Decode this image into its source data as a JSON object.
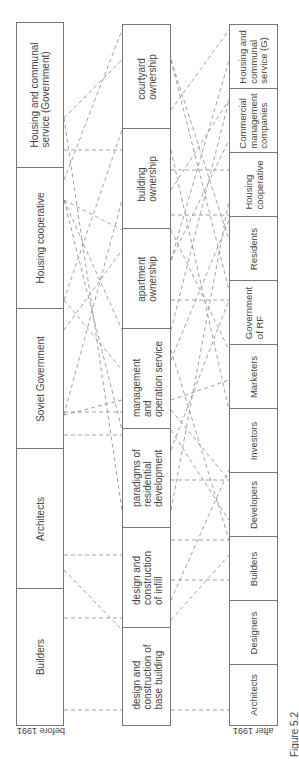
{
  "diagram": {
    "caption": "Figure 5.2",
    "before": {
      "label": "before 1991",
      "actors": [
        {
          "text": "Housing and communal\nservice (Government)",
          "top": 22,
          "bottom": 167
        },
        {
          "text": "Housing cooperative",
          "top": 167,
          "bottom": 308
        },
        {
          "text": "Soviet Government",
          "top": 308,
          "bottom": 448
        },
        {
          "text": "Architects",
          "top": 448,
          "bottom": 588
        },
        {
          "text": "Builders",
          "top": 588,
          "bottom": 725
        }
      ]
    },
    "processes": {
      "items": [
        {
          "text": "courtyard\nownership",
          "top": 24,
          "bottom": 128
        },
        {
          "text": "building\nownership",
          "top": 128,
          "bottom": 228
        },
        {
          "text": "apartment\nownership",
          "top": 228,
          "bottom": 328
        },
        {
          "text": "management\nand\noperation service",
          "top": 328,
          "bottom": 428
        },
        {
          "text": "paradigms of\nresidential\ndevelopment",
          "top": 428,
          "bottom": 527
        },
        {
          "text": "design and\nconstruction\nof infill",
          "top": 527,
          "bottom": 627
        },
        {
          "text": "design and\nconstruction of\nbase building",
          "top": 627,
          "bottom": 725
        }
      ]
    },
    "after": {
      "label": "after 1991",
      "actors": [
        {
          "text": "Housing and\ncommunal\nservice (G)",
          "top": 24,
          "bottom": 88
        },
        {
          "text": "Commercial\nmanagement\ncompanies",
          "top": 88,
          "bottom": 152
        },
        {
          "text": "Housing\ncooperative",
          "top": 152,
          "bottom": 216
        },
        {
          "text": "Residents",
          "top": 216,
          "bottom": 280
        },
        {
          "text": "Government\nof RF",
          "top": 280,
          "bottom": 344
        },
        {
          "text": "Marketers",
          "top": 344,
          "bottom": 408
        },
        {
          "text": "Investors",
          "top": 408,
          "bottom": 472
        },
        {
          "text": "Developers",
          "top": 472,
          "bottom": 536
        },
        {
          "text": "Builders",
          "top": 536,
          "bottom": 600
        },
        {
          "text": "Designers",
          "top": 600,
          "bottom": 664
        },
        {
          "text": "Architects",
          "top": 664,
          "bottom": 725
        }
      ]
    },
    "style": {
      "line_color": "#8a8a8a",
      "box_border": "#777777"
    },
    "links_left": [
      [
        64,
        118,
        122,
        60
      ],
      [
        64,
        118,
        122,
        510
      ],
      [
        64,
        180,
        122,
        30
      ],
      [
        64,
        200,
        122,
        230
      ],
      [
        64,
        200,
        122,
        330
      ],
      [
        64,
        200,
        122,
        430
      ],
      [
        64,
        300,
        122,
        130
      ],
      [
        64,
        300,
        122,
        370
      ],
      [
        64,
        330,
        122,
        250
      ],
      [
        64,
        415,
        122,
        200
      ],
      [
        64,
        415,
        122,
        400
      ],
      [
        64,
        555,
        122,
        555
      ],
      [
        64,
        570,
        122,
        630
      ],
      [
        64,
        618,
        122,
        618
      ],
      [
        64,
        710,
        122,
        710
      ],
      [
        64,
        412,
        122,
        412
      ],
      [
        64,
        435,
        122,
        435
      ],
      [
        64,
        150,
        122,
        150
      ]
    ],
    "links_right": [
      [
        171,
        60,
        229,
        290
      ],
      [
        171,
        60,
        229,
        240
      ],
      [
        171,
        110,
        229,
        30
      ],
      [
        171,
        150,
        229,
        410
      ],
      [
        171,
        170,
        229,
        170
      ],
      [
        171,
        190,
        229,
        100
      ],
      [
        171,
        215,
        229,
        215
      ],
      [
        171,
        230,
        229,
        350
      ],
      [
        171,
        260,
        229,
        140
      ],
      [
        171,
        260,
        229,
        60
      ],
      [
        171,
        300,
        229,
        300
      ],
      [
        171,
        330,
        229,
        100
      ],
      [
        171,
        350,
        229,
        540
      ],
      [
        171,
        360,
        229,
        220
      ],
      [
        171,
        400,
        229,
        380
      ],
      [
        171,
        410,
        229,
        480
      ],
      [
        171,
        430,
        229,
        520
      ],
      [
        171,
        450,
        229,
        300
      ],
      [
        171,
        480,
        229,
        480
      ],
      [
        171,
        510,
        229,
        200
      ],
      [
        171,
        540,
        229,
        540
      ],
      [
        171,
        580,
        229,
        580
      ],
      [
        171,
        620,
        229,
        555
      ],
      [
        171,
        600,
        229,
        470
      ],
      [
        171,
        710,
        229,
        710
      ]
    ]
  }
}
